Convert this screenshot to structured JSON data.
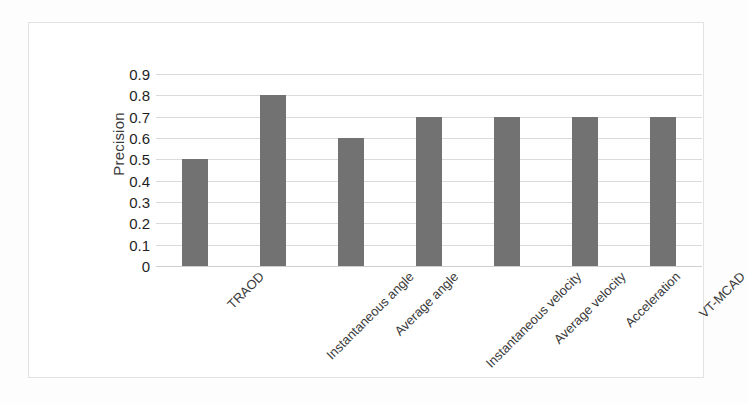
{
  "chart_data": {
    "type": "bar",
    "title": "",
    "xlabel": "",
    "ylabel": "Precision",
    "categories": [
      "TRAOD",
      "Instantaneous angle",
      "Average angle",
      "Instantaneous velocity",
      "Average velocity",
      "Acceleration",
      "VT-MCAD"
    ],
    "values": [
      0.5,
      0.8,
      0.6,
      0.7,
      0.7,
      0.7,
      0.7
    ],
    "ylim": [
      0,
      0.9
    ],
    "ytick_labels": [
      "0.9",
      "0.8",
      "0.7",
      "0.6",
      "0.5",
      "0.4",
      "0.3",
      "0.2",
      "0.1",
      "0"
    ],
    "ytick_values": [
      0.9,
      0.8,
      0.7,
      0.6,
      0.5,
      0.4,
      0.3,
      0.2,
      0.1,
      0
    ],
    "grid": true,
    "legend": false,
    "bar_color": "#727272",
    "gridline_color": "#dadada",
    "plot_background": "#ffffff",
    "frame_border_color": "#e3e3e5",
    "x_label_rotation_deg": -45
  }
}
